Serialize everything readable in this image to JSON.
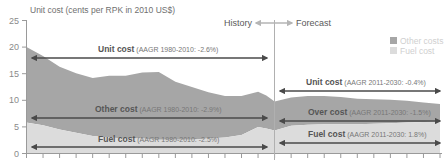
{
  "chart_data": {
    "type": "area",
    "title": "",
    "ylabel": "Unit cost (cents per RPK in 2010 US$)",
    "xlabel": "",
    "ylim": [
      0,
      25
    ],
    "yticks": [
      0,
      5,
      10,
      15,
      20,
      25
    ],
    "x_range": [
      1980,
      2030
    ],
    "x_tick_step_years": 2,
    "grid": false,
    "legend_position": "top-right",
    "divider_year": 2010,
    "x": [
      1980,
      1982,
      1984,
      1986,
      1988,
      1990,
      1992,
      1994,
      1996,
      1998,
      2000,
      2002,
      2004,
      2006,
      2008,
      2009,
      2010,
      2012,
      2014,
      2016,
      2018,
      2020,
      2022,
      2024,
      2026,
      2028,
      2030
    ],
    "series": [
      {
        "name": "Other costs",
        "color": "#a6a6a6",
        "values": [
          14.2,
          13.0,
          11.8,
          11.2,
          10.9,
          11.6,
          11.8,
          12.4,
          12.7,
          10.9,
          9.9,
          8.7,
          7.8,
          7.3,
          6.6,
          6.2,
          5.5,
          5.3,
          5.4,
          5.3,
          5.1,
          4.8,
          4.6,
          4.4,
          4.1,
          3.7,
          3.3
        ]
      },
      {
        "name": "Fuel cost",
        "color": "#dcdcdc",
        "values": [
          5.8,
          5.3,
          4.5,
          3.9,
          3.3,
          3.0,
          2.8,
          2.8,
          2.6,
          2.6,
          2.6,
          2.8,
          3.0,
          3.5,
          5.0,
          4.7,
          4.3,
          5.2,
          5.4,
          5.5,
          5.5,
          5.5,
          5.6,
          5.7,
          5.8,
          5.9,
          6.0
        ]
      }
    ],
    "unit_cost_total": [
      20.0,
      18.3,
      16.3,
      15.1,
      14.2,
      14.6,
      14.6,
      15.2,
      15.3,
      13.5,
      12.5,
      11.5,
      10.8,
      10.8,
      11.6,
      10.9,
      9.8,
      10.5,
      10.8,
      10.8,
      10.6,
      10.3,
      10.2,
      10.1,
      9.9,
      9.6,
      9.3
    ],
    "annotations": {
      "phase_history": "History",
      "phase_forecast": "Forecast",
      "history": [
        {
          "bold": "Unit cost",
          "light": "(AAGR 1980-2010: -2.6%)",
          "y_value": 18
        },
        {
          "bold": "Other cost",
          "light": "(AAGR 1980-2010: -2.9%)",
          "y_value": 6.5
        },
        {
          "bold": "Fuel cost",
          "light": "(AAGR 1980-2010: -2.5%)",
          "y_value": 1.2
        }
      ],
      "forecast": [
        {
          "bold": "Unit cost",
          "light": "(AAGR 2011-2030: -0.4%)",
          "y_value": 12
        },
        {
          "bold": "Over cost",
          "light": "(AAGR 2011-2030: -1.5%)",
          "y_value": 6.5
        },
        {
          "bold": "Fuel cost",
          "light": "(AAGR 2011-2030: 1.8%)",
          "y_value": 1.8
        }
      ]
    },
    "legend": [
      {
        "label": "Other costs",
        "color": "#a6a6a6"
      },
      {
        "label": "Fuel cost",
        "color": "#dcdcdc"
      }
    ]
  },
  "axis": {
    "ylabel": "Unit cost (cents per RPK in 2010 US$)",
    "ytick_labels": [
      "25",
      "20",
      "15",
      "10",
      "5",
      "0"
    ]
  },
  "phases": {
    "history": "History",
    "forecast": "Forecast"
  },
  "legend": {
    "other": "Other costs",
    "fuel": "Fuel cost"
  },
  "labels": {
    "h_unit_bold": "Unit cost",
    "h_unit_light": " (AAGR 1980-2010: -2.6%)",
    "h_other_bold": "Other cost",
    "h_other_light": " (AAGR 1980-2010: -2.9%)",
    "h_fuel_bold": "Fuel cost",
    "h_fuel_light": " (AAGR 1980-2010: -2.5%)",
    "f_unit_bold": "Unit cost",
    "f_unit_light": " (AAGR 2011-2030: -0.4%)",
    "f_other_bold": "Over cost",
    "f_other_light": " (AAGR 2011-2030: -1.5%)",
    "f_fuel_bold": "Fuel cost",
    "f_fuel_light": " (AAGR 2011-2030: 1.8%)"
  }
}
